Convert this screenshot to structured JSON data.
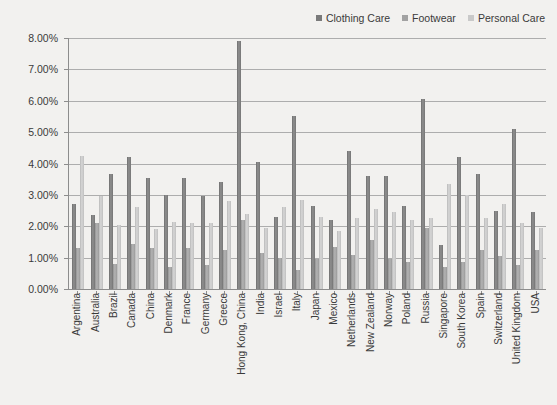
{
  "legend": {
    "position": "top-right",
    "items": [
      {
        "label": "Clothing Care",
        "color": "#7a7a7a"
      },
      {
        "label": "Footwear",
        "color": "#a2a2a2"
      },
      {
        "label": "Personal Care",
        "color": "#c9c9c9"
      }
    ]
  },
  "axis": {
    "y_ticks": [
      "0.00%",
      "1.00%",
      "2.00%",
      "3.00%",
      "4.00%",
      "5.00%",
      "6.00%",
      "7.00%",
      "8.00%"
    ]
  },
  "chart_data": {
    "type": "bar",
    "title": "",
    "subtitle": "",
    "xlabel": "",
    "ylabel": "",
    "ylim": [
      0,
      8
    ],
    "ytick_step": 1,
    "ytick_format": "percent",
    "grid": true,
    "legend_position": "top-right",
    "categories": [
      "Argentina",
      "Australia",
      "Brazil",
      "Canada",
      "China",
      "Denmark",
      "France",
      "Germany",
      "Greece",
      "Hong Kong, China",
      "India",
      "Israel",
      "Italy",
      "Japan",
      "Mexico",
      "Netherlands",
      "New Zealand",
      "Norway",
      "Poland",
      "Russia",
      "Singapore",
      "South Korea",
      "Spain",
      "Switzerland",
      "United Kingdom",
      "USA"
    ],
    "series": [
      {
        "name": "Clothing Care",
        "color": "#7a7a7a",
        "values": [
          2.7,
          2.35,
          3.65,
          4.2,
          3.55,
          3.0,
          3.55,
          2.95,
          3.4,
          7.9,
          4.05,
          2.3,
          5.5,
          2.65,
          2.2,
          4.4,
          3.6,
          3.6,
          2.65,
          6.05,
          1.4,
          4.2,
          3.65,
          2.5,
          5.1,
          2.45
        ]
      },
      {
        "name": "Footwear",
        "color": "#a2a2a2",
        "values": [
          1.3,
          2.1,
          0.8,
          1.45,
          1.3,
          0.7,
          1.3,
          0.75,
          1.25,
          2.2,
          1.15,
          1.0,
          0.6,
          0.95,
          1.35,
          1.1,
          1.55,
          0.95,
          0.85,
          1.95,
          0.7,
          0.85,
          1.25,
          1.05,
          0.75,
          1.25
        ]
      },
      {
        "name": "Personal Care",
        "color": "#c9c9c9",
        "values": [
          4.25,
          2.95,
          2.05,
          2.6,
          1.9,
          2.15,
          2.1,
          2.1,
          2.8,
          2.4,
          1.95,
          2.6,
          2.85,
          2.3,
          1.85,
          2.25,
          2.55,
          2.45,
          2.2,
          2.25,
          3.35,
          3.0,
          2.25,
          2.7,
          2.1,
          1.95
        ]
      }
    ]
  }
}
